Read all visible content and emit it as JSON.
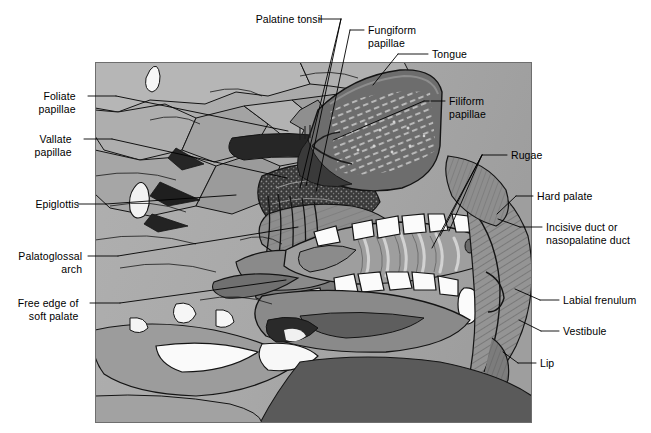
{
  "figure": {
    "type": "anatomical-illustration",
    "style": "grayscale line drawing",
    "frame": {
      "x": 95,
      "y": 62,
      "width": 437,
      "height": 361
    },
    "palette": {
      "background": "#ffffff",
      "plate_base": "#a9a9a9",
      "light_gray": "#c4c4c4",
      "mid_gray": "#9a9a9a",
      "dark_gray": "#6d6d6d",
      "darker_gray": "#565656",
      "near_black": "#1c1c1c",
      "white_structure": "#fbfbfb",
      "outline": "#111111",
      "leader_line": "#000000"
    },
    "regions": [
      {
        "name": "tongue",
        "tone": "#6d6d6d"
      },
      {
        "name": "hard-palate",
        "tone": "#9a9a9a"
      },
      {
        "name": "rugae",
        "tone": "#8e8e8e"
      },
      {
        "name": "teeth",
        "tone": "#fbfbfb"
      },
      {
        "name": "lip",
        "tone": "#8a8a8a"
      },
      {
        "name": "soft-palate",
        "tone": "#7a7a7a"
      },
      {
        "name": "pharynx",
        "tone": "#b4b4b4"
      },
      {
        "name": "epiglottis",
        "tone": "#f4f4f4"
      }
    ]
  },
  "labels": [
    {
      "id": "palatine-tonsil",
      "text": "Palatine tonsil",
      "align": "right",
      "x": 237,
      "y": 13,
      "lines": [
        [
          319,
          19,
          341,
          19
        ],
        [
          341,
          19,
          306,
          186
        ],
        [
          341,
          19,
          300,
          188
        ]
      ]
    },
    {
      "id": "fungiform-papillae",
      "text": "Fungiform\npapillae",
      "align": "left",
      "x": 368,
      "y": 24,
      "lines": [
        [
          364,
          30,
          350,
          30
        ],
        [
          350,
          30,
          316,
          192
        ]
      ]
    },
    {
      "id": "tongue",
      "text": "Tongue",
      "align": "left",
      "x": 432,
      "y": 48,
      "lines": [
        [
          428,
          54,
          398,
          54
        ],
        [
          398,
          54,
          373,
          85
        ]
      ]
    },
    {
      "id": "filiform-papillae",
      "text": "Filiform\npapillae",
      "align": "left",
      "x": 449,
      "y": 95,
      "lines": [
        [
          445,
          101,
          424,
          101
        ],
        [
          424,
          101,
          333,
          140
        ]
      ]
    },
    {
      "id": "foliate-papillae",
      "text": "Foliate\npapillae",
      "align": "right",
      "x": 30,
      "y": 90,
      "lines": [
        [
          88,
          96,
          116,
          96
        ],
        [
          116,
          96,
          288,
          131
        ]
      ]
    },
    {
      "id": "vallate-papillae",
      "text": "Vallate\npapillae",
      "align": "right",
      "x": 26,
      "y": 133,
      "lines": [
        [
          84,
          139,
          112,
          139
        ],
        [
          112,
          139,
          287,
          178
        ]
      ]
    },
    {
      "id": "epiglottis",
      "text": "Epiglottis",
      "align": "right",
      "x": 22,
      "y": 198,
      "lines": [
        [
          78,
          204,
          106,
          204
        ],
        [
          106,
          204,
          236,
          195
        ]
      ]
    },
    {
      "id": "palatoglossal-arch",
      "text": "Palatoglossal\narch",
      "align": "right",
      "x": 8,
      "y": 250,
      "lines": [
        [
          88,
          256,
          118,
          256
        ],
        [
          118,
          256,
          298,
          227
        ]
      ]
    },
    {
      "id": "free-edge-soft-palate",
      "text": "Free edge of\nsoft palate",
      "align": "right",
      "x": 10,
      "y": 297,
      "lines": [
        [
          90,
          303,
          120,
          303
        ],
        [
          120,
          303,
          286,
          280
        ]
      ]
    },
    {
      "id": "rugae",
      "text": "Rugae",
      "align": "left",
      "x": 511,
      "y": 149,
      "lines": [
        [
          507,
          155,
          482,
          155
        ],
        [
          482,
          155,
          449,
          231
        ],
        [
          482,
          155,
          440,
          236
        ],
        [
          482,
          155,
          432,
          248
        ]
      ]
    },
    {
      "id": "hard-palate",
      "text": "Hard palate",
      "align": "left",
      "x": 537,
      "y": 190,
      "lines": [
        [
          533,
          196,
          516,
          196
        ],
        [
          516,
          196,
          497,
          214
        ]
      ]
    },
    {
      "id": "incisive-duct",
      "text": "Incisive duct or\nnasopalatine duct",
      "align": "left",
      "x": 546,
      "y": 221,
      "lines": [
        [
          542,
          227,
          520,
          227
        ],
        [
          520,
          227,
          498,
          219
        ]
      ]
    },
    {
      "id": "labial-frenulum",
      "text": "Labial frenulum",
      "align": "left",
      "x": 563,
      "y": 294,
      "lines": [
        [
          559,
          300,
          540,
          300
        ],
        [
          540,
          300,
          515,
          289
        ]
      ]
    },
    {
      "id": "vestibule",
      "text": "Vestibule",
      "align": "left",
      "x": 563,
      "y": 325,
      "lines": [
        [
          559,
          331,
          541,
          331
        ],
        [
          541,
          331,
          519,
          320
        ]
      ]
    },
    {
      "id": "lip",
      "text": "Lip",
      "align": "left",
      "x": 540,
      "y": 357,
      "lines": [
        [
          536,
          363,
          518,
          363
        ],
        [
          518,
          363,
          503,
          352
        ]
      ]
    }
  ]
}
